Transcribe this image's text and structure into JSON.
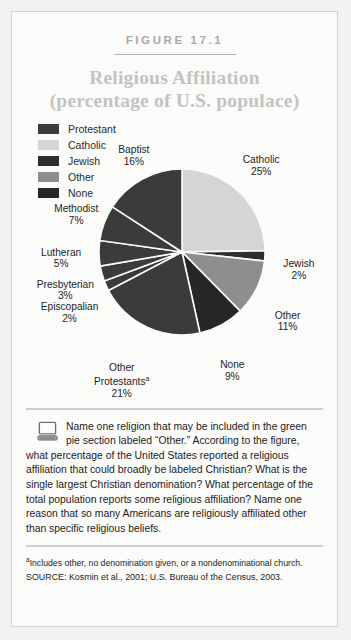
{
  "figure": {
    "label": "FIGURE 17.1",
    "title_line1": "Religious Affiliation",
    "title_line2": "(percentage of U.S. populace)"
  },
  "legend": {
    "items": [
      {
        "label": "Protestant",
        "color": "#3b3b3b"
      },
      {
        "label": "Catholic",
        "color": "#d5d5d5"
      },
      {
        "label": "Jewish",
        "color": "#2e2e2e"
      },
      {
        "label": "Other",
        "color": "#8e8e8e"
      },
      {
        "label": "None",
        "color": "#262626"
      }
    ]
  },
  "chart_data": {
    "type": "pie",
    "title": "Religious Affiliation (percentage of U.S. populace)",
    "ylabel": "",
    "xlabel": "",
    "legend_position": "top-left",
    "start_angle_deg": 0,
    "direction": "clockwise",
    "categories": [
      "Catholic",
      "Jewish",
      "Other",
      "None",
      "Other Protestants",
      "Episcopalian",
      "Presbyterian",
      "Lutheran",
      "Methodist",
      "Baptist"
    ],
    "values": [
      25,
      2,
      11,
      9,
      21,
      2,
      3,
      5,
      7,
      16
    ],
    "slices": [
      {
        "name": "Catholic",
        "value": 25,
        "label": "Catholic",
        "pct": "25%",
        "color": "#d5d5d5",
        "group": "Catholic"
      },
      {
        "name": "Jewish",
        "value": 2,
        "label": "Jewish",
        "pct": "2%",
        "color": "#2e2e2e",
        "group": "Jewish"
      },
      {
        "name": "Other",
        "value": 11,
        "label": "Other",
        "pct": "11%",
        "color": "#8e8e8e",
        "group": "Other"
      },
      {
        "name": "None",
        "value": 9,
        "label": "None",
        "pct": "9%",
        "color": "#262626",
        "group": "None"
      },
      {
        "name": "Other Protestants",
        "value": 21,
        "label": "Other Protestants",
        "pct": "21%",
        "color": "#3b3b3b",
        "group": "Protestant",
        "footnote_marker": "a"
      },
      {
        "name": "Episcopalian",
        "value": 2,
        "label": "Episcopalian",
        "pct": "2%",
        "color": "#3b3b3b",
        "group": "Protestant"
      },
      {
        "name": "Presbyterian",
        "value": 3,
        "label": "Presbyterian",
        "pct": "3%",
        "color": "#3b3b3b",
        "group": "Protestant"
      },
      {
        "name": "Lutheran",
        "value": 5,
        "label": "Lutheran",
        "pct": "5%",
        "color": "#3b3b3b",
        "group": "Protestant"
      },
      {
        "name": "Methodist",
        "value": 7,
        "label": "Methodist",
        "pct": "7%",
        "color": "#3b3b3b",
        "group": "Protestant"
      },
      {
        "name": "Baptist",
        "value": 16,
        "label": "Baptist",
        "pct": "16%",
        "color": "#3b3b3b",
        "group": "Protestant"
      }
    ]
  },
  "caption": {
    "icon": "computer-monitor-icon",
    "text": "Name one religion that may be included in the green pie section labeled “Other.” According to the figure, what percentage of the United States reported a religious affiliation that could broadly be labeled Christian? What is the single largest Christian denomination? What percentage of the total population reports some religious affiliation? Name one reason that so many Americans are religiously affiliated other than specific religious beliefs."
  },
  "footnote": {
    "marker": "a",
    "text": "Includes other, no denomination given, or a nondenominational church."
  },
  "source": {
    "text": "SOURCE: Kosmin et al., 2001; U.S. Bureau of the Census, 2003."
  }
}
